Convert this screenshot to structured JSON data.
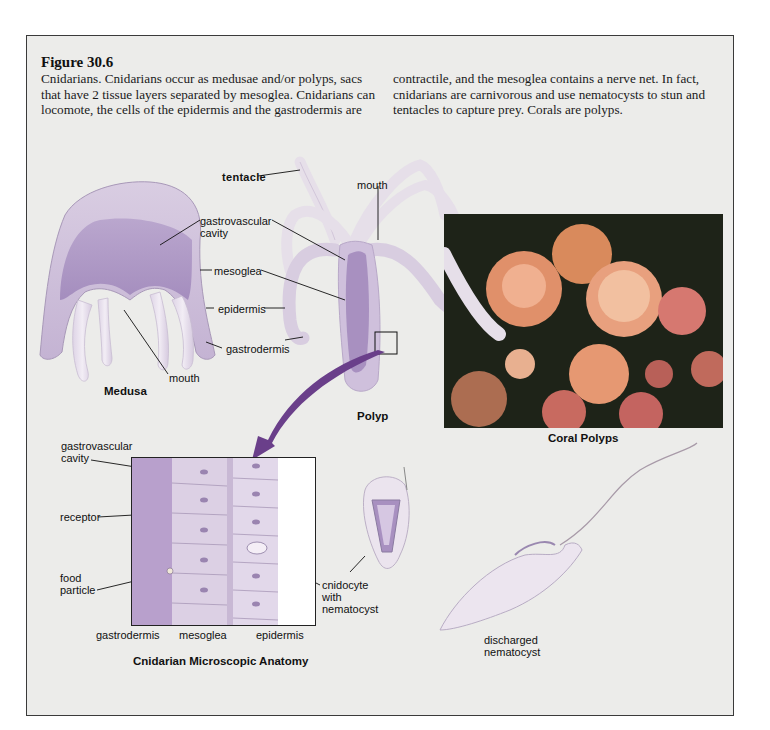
{
  "figure": {
    "title": "Figure 30.6",
    "caption_col1": "Cnidarians. Cnidarians occur as medusae and/or polyps, sacs that have 2 tissue layers separated by mesoglea. Cnidarians can locomote, the cells of the epidermis and the gastrodermis are",
    "caption_col2": "contractile, and the mesoglea contains a nerve net. In fact, cnidarians are carnivorous and use nematocysts to stun and tentacles to capture prey. Corals are polyps."
  },
  "medusa": {
    "title": "Medusa",
    "labels": {
      "gastrovascular_cavity_1": "gastrovascular",
      "gastrovascular_cavity_2": "cavity",
      "mesoglea": "mesoglea",
      "epidermis": "epidermis",
      "gastrodermis": "gastrodermis",
      "mouth": "mouth"
    }
  },
  "polyp": {
    "title": "Polyp",
    "labels": {
      "tentacle": "tentacle",
      "mouth": "mouth"
    }
  },
  "coral": {
    "title": "Coral Polyps"
  },
  "micro": {
    "title": "Cnidarian Microscopic Anatomy",
    "labels": {
      "gastrovascular_cavity_1": "gastrovascular",
      "gastrovascular_cavity_2": "cavity",
      "receptor": "receptor",
      "food_particle_1": "food",
      "food_particle_2": "particle",
      "gastrodermis": "gastrodermis",
      "mesoglea": "mesoglea",
      "epidermis": "epidermis",
      "cnidocyte_1": "cnidocyte",
      "cnidocyte_2": "with",
      "cnidocyte_3": "nematocyst"
    }
  },
  "nematocyst": {
    "label_1": "discharged",
    "label_2": "nematocyst"
  },
  "colors": {
    "frame_bg": "#ececea",
    "body_lavender": "#c9b8d8",
    "cavity_purple": "#a890c0",
    "arrow_purple": "#6a3f8a"
  }
}
